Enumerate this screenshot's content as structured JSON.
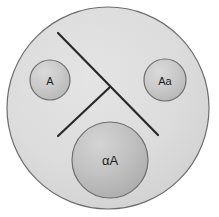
{
  "figure": {
    "name": "cell-with-three-inclusions-and-spindle",
    "canvas": {
      "width": 219,
      "height": 217,
      "background": "#ffffff"
    },
    "outer_cell": {
      "name": "outer-cell-boundary",
      "cx": 108,
      "cy": 108,
      "r": 101,
      "fill": "#dcdcdc",
      "stroke": "#6e6e6e",
      "stroke_width": 1.2
    },
    "nodes": [
      {
        "id": "node-a",
        "label": "A",
        "cx": 50,
        "cy": 80,
        "r": 20,
        "fill": "#c6c6c6",
        "highlight": "#d8d8d8",
        "stroke": "#6e6e6e",
        "font_class": "label-small"
      },
      {
        "id": "node-aa",
        "label": "Aa",
        "cx": 165,
        "cy": 80,
        "r": 21,
        "fill": "#c6c6c6",
        "highlight": "#d8d8d8",
        "stroke": "#6e6e6e",
        "font_class": "label-small"
      },
      {
        "id": "node-alpha-a",
        "label": "αA",
        "cx": 110,
        "cy": 160,
        "r": 38,
        "fill": "#bdbdbd",
        "highlight": "#d2d2d2",
        "stroke": "#6e6e6e",
        "font_class": "label-large"
      }
    ],
    "lines": [
      {
        "id": "line-main-diagonal",
        "name": "spindle-line-main",
        "x1": 58,
        "y1": 33,
        "x2": 158,
        "y2": 135,
        "stroke": "#2a2a2a",
        "stroke_width": 2.2
      },
      {
        "id": "line-branch",
        "name": "spindle-line-branch",
        "x1": 58,
        "y1": 136,
        "x2": 110,
        "y2": 87,
        "stroke": "#2a2a2a",
        "stroke_width": 2.2
      }
    ]
  },
  "colors": {
    "cell_fill": "#dcdcdc",
    "node_fill": "#c6c6c6",
    "node_fill_large": "#bdbdbd",
    "outline": "#6e6e6e",
    "line": "#2a2a2a",
    "text": "#1c1c1c"
  }
}
